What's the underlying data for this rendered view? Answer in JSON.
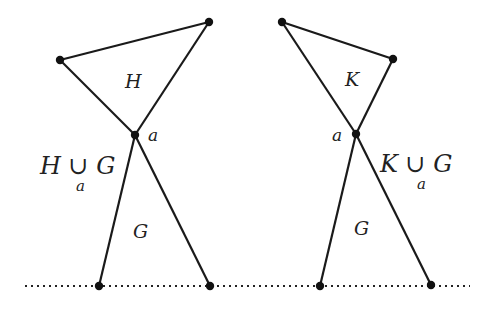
{
  "diagram": {
    "left": {
      "triangle_label": "H",
      "apex_label": "a",
      "union_label": "H ∪ G",
      "union_subscript": "a",
      "lower_label": "G",
      "vertices": {
        "top_left": [
          60,
          60
        ],
        "top_right": [
          209,
          22
        ],
        "apex": [
          135,
          135
        ],
        "bottom_left": [
          99,
          286
        ],
        "bottom_right": [
          210,
          286
        ]
      }
    },
    "right": {
      "triangle_label": "K",
      "apex_label": "a",
      "union_label": "K ∪ G",
      "union_subscript": "a",
      "lower_label": "G",
      "vertices": {
        "top_left": [
          282,
          22
        ],
        "top_right": [
          393,
          59
        ],
        "apex": [
          356,
          134
        ],
        "bottom_left": [
          320,
          286
        ],
        "bottom_right": [
          431,
          285
        ]
      }
    },
    "baseline": {
      "style": "dotted",
      "y": 286,
      "x_start": 25,
      "x_end": 470
    }
  }
}
